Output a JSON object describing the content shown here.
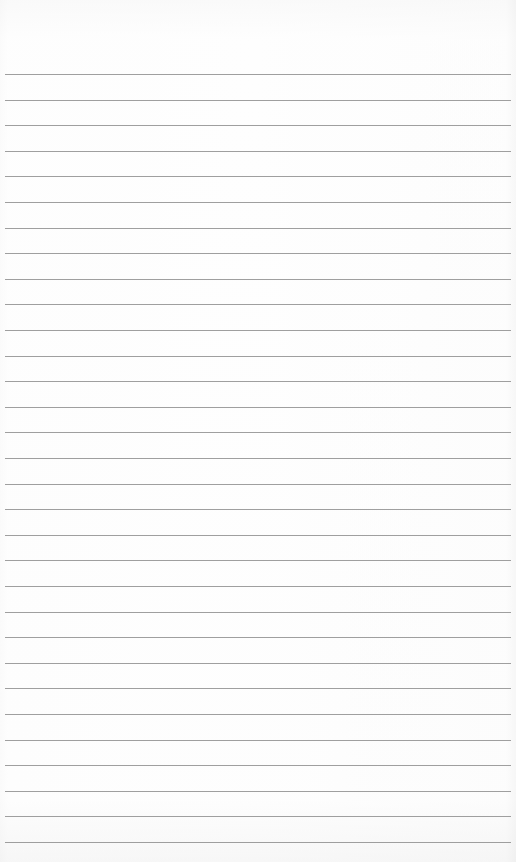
{
  "paper": {
    "description": "Blank lined notebook paper",
    "line_count": 31,
    "first_line_y": 74,
    "line_spacing": 25.6,
    "line_left": 5,
    "line_width": 506,
    "line_color": "#8e8e8e",
    "background_color": "#fbfbfb"
  }
}
